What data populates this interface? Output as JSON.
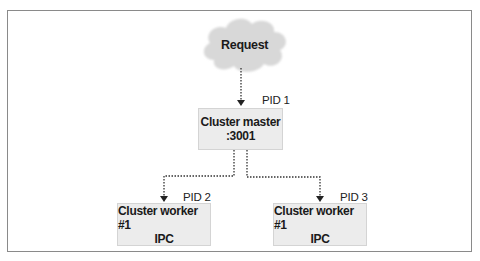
{
  "diagram": {
    "request": {
      "label": "Request",
      "shape": "cloud"
    },
    "master": {
      "pid": "PID 1",
      "line1": "Cluster master",
      "line2": ":3001"
    },
    "workers": [
      {
        "pid": "PID 2",
        "line1": "Cluster worker #1",
        "line2": "IPC"
      },
      {
        "pid": "PID 3",
        "line1": "Cluster worker #1",
        "line2": "IPC"
      }
    ],
    "edges": [
      {
        "from": "Request",
        "to": "Cluster master",
        "style": "dotted-arrow"
      },
      {
        "from": "Cluster master",
        "to": "Cluster worker #1 (PID 2)",
        "style": "dotted-arrow"
      },
      {
        "from": "Cluster master",
        "to": "Cluster worker #1 (PID 3)",
        "style": "dotted-arrow"
      }
    ],
    "colors": {
      "node_fill": "#ececec",
      "cloud_fill": "#d9d9d9",
      "line": "#333333",
      "frame": "#8a8a8a"
    }
  }
}
